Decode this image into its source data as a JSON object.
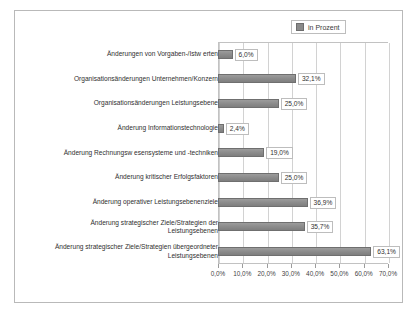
{
  "chart_data": {
    "type": "bar",
    "orientation": "horizontal",
    "title": "",
    "xlabel": "",
    "ylabel": "",
    "xlim": [
      0,
      70
    ],
    "grid": true,
    "legend_position": "top-right",
    "legend": [
      "in Prozent"
    ],
    "xticks": [
      "0,0%",
      "10,0%",
      "20,0%",
      "30,0%",
      "40,0%",
      "50,0%",
      "60,0%",
      "70,0%"
    ],
    "xtick_values": [
      0,
      10,
      20,
      30,
      40,
      50,
      60,
      70
    ],
    "categories": [
      "Änderungen von Vorgaben-/Istw erten",
      "Organisationsänderungen Unternehmen/Konzern",
      "Organisationsänderungen Leistungsebene",
      "Änderung Informationstechnologie",
      "Änderung Rechnungsw esensysteme und -techniken",
      "Änderung kritischer Erfolgsfaktoren",
      "Änderung operativer Leistungsebenenziele",
      "Änderung strategischer Ziele/Strategien der\nLeistungsebenen",
      "Änderung strategischer Ziele/Strategien übergeordneter\nLeistungsebenen"
    ],
    "values": [
      6.0,
      32.1,
      25.0,
      2.4,
      19.0,
      25.0,
      36.9,
      35.7,
      63.1
    ],
    "data_labels": [
      "6,0%",
      "32,1%",
      "25,0%",
      "2,4%",
      "19,0%",
      "25,0%",
      "36,9%",
      "35,7%",
      "63,1%"
    ],
    "series": [
      {
        "name": "in Prozent",
        "color": "#8a8a8a",
        "values": [
          6.0,
          32.1,
          25.0,
          2.4,
          19.0,
          25.0,
          36.9,
          35.7,
          63.1
        ]
      }
    ]
  },
  "colors": {
    "bar": "#8a8a8a",
    "bar_border": "#6f6f6f",
    "grid": "#d2d2d2",
    "frame": "#b9b9b9",
    "text": "#2f2f2f",
    "background": "#ffffff"
  }
}
